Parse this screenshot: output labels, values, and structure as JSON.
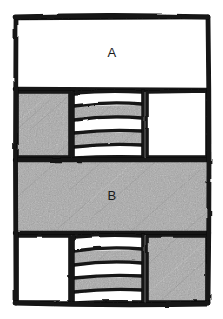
{
  "diagram": {
    "kind": "hand-drawn-sketch",
    "title": "",
    "background_color": "#ffffff",
    "ink_color": "#121212",
    "fill_white": "#ffffff",
    "fill_gray": "#a9a9a9",
    "frame": {
      "x": 14,
      "y": 16,
      "width": 196,
      "height": 289
    },
    "rows": [
      {
        "id": "row-a",
        "label": "A",
        "y": 18,
        "height": 72,
        "cells": [
          {
            "id": "row-a-full",
            "x": 16,
            "width": 192,
            "fill": "white",
            "label": "A"
          }
        ]
      },
      {
        "id": "row-middle",
        "label": "",
        "y": 92,
        "height": 66,
        "cells": [
          {
            "id": "mid-left-block",
            "x": 16,
            "width": 54,
            "fill": "gray",
            "label": ""
          },
          {
            "id": "mid-stripe-stack",
            "x": 74,
            "width": 68,
            "fill": "striped",
            "label": ""
          },
          {
            "id": "mid-right-block",
            "x": 146,
            "width": 62,
            "fill": "white",
            "label": ""
          }
        ],
        "stripes": [
          "white",
          "gray",
          "white",
          "gray",
          "white"
        ]
      },
      {
        "id": "row-b",
        "label": "B",
        "y": 161,
        "height": 71,
        "cells": [
          {
            "id": "row-b-full",
            "x": 16,
            "width": 192,
            "fill": "gray",
            "label": "B"
          }
        ]
      },
      {
        "id": "row-bottom",
        "label": "",
        "y": 236,
        "height": 67,
        "cells": [
          {
            "id": "bottom-left-block",
            "x": 16,
            "width": 54,
            "fill": "white",
            "label": ""
          },
          {
            "id": "bottom-stripe-stack",
            "x": 74,
            "width": 68,
            "fill": "striped",
            "label": ""
          },
          {
            "id": "bottom-right-block",
            "x": 146,
            "width": 62,
            "fill": "gray",
            "label": ""
          }
        ],
        "stripes": [
          "white",
          "gray",
          "white",
          "gray",
          "white"
        ]
      }
    ],
    "labels": [
      {
        "id": "label-a",
        "text": "A",
        "x": 112,
        "y": 54
      },
      {
        "id": "label-b",
        "text": "B",
        "x": 112,
        "y": 197
      }
    ]
  }
}
